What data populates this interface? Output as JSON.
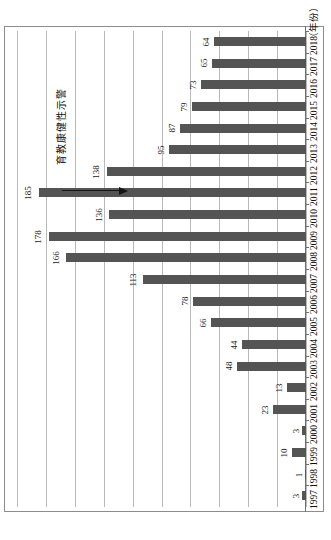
{
  "chart_data": {
    "type": "bar",
    "orientation": "horizontal-rotated",
    "title": "",
    "xlabel": "",
    "ylabel": "",
    "axis_title": "（年份）",
    "categories": [
      "1997",
      "1998",
      "1999",
      "2000",
      "2001",
      "2002",
      "2003",
      "2004",
      "2005",
      "2006",
      "2007",
      "2008",
      "2009",
      "2010",
      "2011",
      "2012",
      "2013",
      "2014",
      "2015",
      "2016",
      "2017",
      "2018"
    ],
    "values": [
      3,
      1,
      10,
      3,
      23,
      13,
      48,
      44,
      66,
      78,
      113,
      166,
      178,
      136,
      185,
      138,
      95,
      87,
      79,
      73,
      65,
      64
    ],
    "value_labels": [
      "3",
      "1",
      "10",
      "3",
      "23",
      "13",
      "48",
      "44",
      "66",
      "78",
      "113",
      "166",
      "178",
      "136",
      "185",
      "138",
      "95",
      "87",
      "79",
      "73",
      "65",
      "64"
    ],
    "ylim": [
      0,
      200
    ],
    "grid": true,
    "gridline_values": [
      0,
      20,
      40,
      60,
      80,
      100,
      120,
      140,
      160,
      180,
      200
    ],
    "bar_color": "#545454",
    "gridline_color": "#b9b9b9",
    "axis_color": "#6f6f6f",
    "legend_position": "none",
    "annotations": [
      {
        "text": "警示性健康教育",
        "characters": [
          "警",
          "示",
          "性",
          "健",
          "康",
          "教",
          "育"
        ],
        "arrow": "right-arrow"
      }
    ]
  }
}
